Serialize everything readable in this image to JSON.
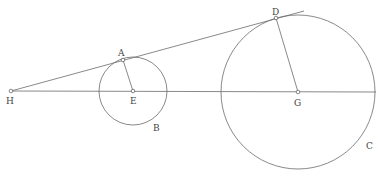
{
  "diagram": {
    "type": "geometry",
    "colors": {
      "stroke": "#6b6b6b",
      "label": "#444444",
      "background": "#ffffff"
    },
    "points": {
      "H": {
        "label": "H",
        "x": 11,
        "y": 91
      },
      "A": {
        "label": "A",
        "x": 123,
        "y": 60
      },
      "E": {
        "label": "E",
        "x": 133,
        "y": 91
      },
      "D": {
        "label": "D",
        "x": 276,
        "y": 18
      },
      "G": {
        "label": "G",
        "x": 298,
        "y": 92
      }
    },
    "circles": {
      "B": {
        "label": "B",
        "center": "E",
        "r": 34
      },
      "C": {
        "label": "C",
        "center": "G",
        "r": 77
      }
    },
    "labels": {
      "H": "H",
      "A": "A",
      "E": "E",
      "D": "D",
      "G": "G",
      "B": "B",
      "C": "C"
    }
  }
}
